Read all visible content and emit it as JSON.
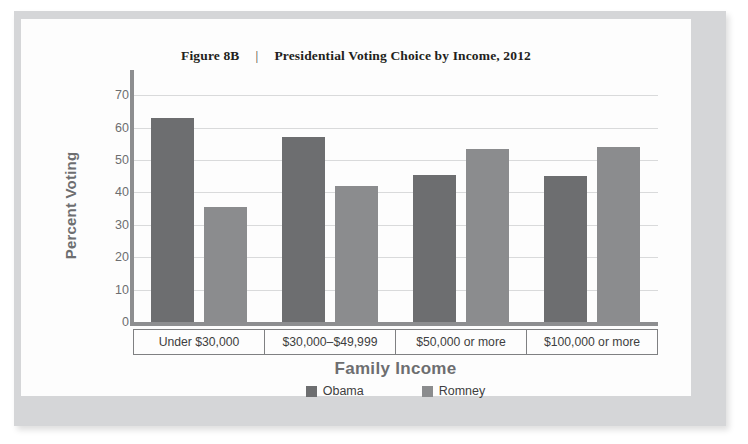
{
  "figure": {
    "number": "Figure 8B",
    "separator": "|",
    "title": "Presidential Voting Choice by Income, 2012"
  },
  "chart_data": {
    "type": "bar",
    "title": "Presidential Voting Choice by Income, 2012",
    "xlabel": "Family Income",
    "ylabel": "Percent Voting",
    "ylim": [
      0,
      75
    ],
    "yticks": [
      0,
      10,
      20,
      30,
      40,
      50,
      60,
      70
    ],
    "ytick_labels": [
      "0",
      "10",
      "20",
      "30",
      "40",
      "50",
      "60",
      "70"
    ],
    "grid": true,
    "legend_position": "bottom",
    "categories": [
      "Under $30,000",
      "$30,000–$49,999",
      "$50,000 or more",
      "$100,000 or more"
    ],
    "series": [
      {
        "name": "Obama",
        "color": "#6d6e70",
        "values": [
          63,
          57,
          45.5,
          45
        ]
      },
      {
        "name": "Romney",
        "color": "#8b8c8e",
        "values": [
          35.5,
          42,
          53.5,
          54
        ]
      }
    ]
  },
  "colors": {
    "obama": "#6d6e70",
    "romney": "#8b8c8e",
    "axis": "#8d8e90",
    "grid": "#d9dadb",
    "frame": "#d5d6d8",
    "text": "#6d6e70"
  }
}
